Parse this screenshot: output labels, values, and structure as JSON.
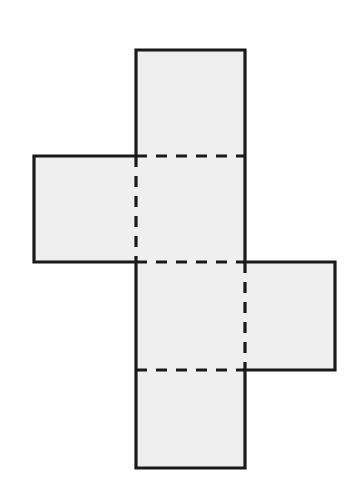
{
  "figure": {
    "type": "geometric-diagram",
    "canvas": {
      "width": 357,
      "height": 490
    },
    "colors": {
      "background": "#ffffff",
      "face_fill": "#efefef",
      "edge_stroke": "#1a1a1a",
      "fold_stroke": "#1a1a1a"
    },
    "stroke": {
      "outline_width": 3.2,
      "fold_width": 3.2,
      "fold_dash": "11 9"
    },
    "grid": {
      "columns_x": [
        34,
        136,
        245,
        335
      ],
      "rows_y": [
        50,
        156,
        262,
        370,
        468
      ]
    },
    "faces": [
      {
        "name": "top-face",
        "x": 136,
        "y": 50,
        "w": 109,
        "h": 106
      },
      {
        "name": "left-face",
        "x": 34,
        "y": 156,
        "w": 102,
        "h": 106
      },
      {
        "name": "front-upper-face",
        "x": 136,
        "y": 156,
        "w": 109,
        "h": 106
      },
      {
        "name": "front-lower-face",
        "x": 136,
        "y": 262,
        "w": 109,
        "h": 108
      },
      {
        "name": "right-face",
        "x": 245,
        "y": 262,
        "w": 90,
        "h": 108
      },
      {
        "name": "bottom-face",
        "x": 136,
        "y": 370,
        "w": 109,
        "h": 98
      }
    ],
    "outline_path": "M 136 50 L 245 50 L 245 262 L 335 262 L 335 370 L 245 370 L 245 468 L 136 468 L 136 262 L 34 262 L 34 156 L 136 156 Z",
    "solid_edges": [
      {
        "name": "top-face-top-edge",
        "x1": 136,
        "y1": 50,
        "x2": 245,
        "y2": 50
      },
      {
        "name": "top-face-left-edge",
        "x1": 136,
        "y1": 50,
        "x2": 136,
        "y2": 156
      },
      {
        "name": "top-face-right-edge",
        "x1": 245,
        "y1": 50,
        "x2": 245,
        "y2": 156
      },
      {
        "name": "left-face-top-edge",
        "x1": 34,
        "y1": 156,
        "x2": 136,
        "y2": 156
      },
      {
        "name": "left-face-left-edge",
        "x1": 34,
        "y1": 156,
        "x2": 34,
        "y2": 262
      },
      {
        "name": "left-face-bottom-edge",
        "x1": 34,
        "y1": 262,
        "x2": 136,
        "y2": 262
      },
      {
        "name": "center-right-edge",
        "x1": 245,
        "y1": 156,
        "x2": 245,
        "y2": 262
      },
      {
        "name": "right-face-top-edge",
        "x1": 245,
        "y1": 262,
        "x2": 335,
        "y2": 262
      },
      {
        "name": "right-face-right-edge",
        "x1": 335,
        "y1": 262,
        "x2": 335,
        "y2": 370
      },
      {
        "name": "right-face-bottom-edge",
        "x1": 245,
        "y1": 370,
        "x2": 335,
        "y2": 370
      },
      {
        "name": "center-left-edge-lower",
        "x1": 136,
        "y1": 262,
        "x2": 136,
        "y2": 468
      },
      {
        "name": "bottom-face-bottom-edge",
        "x1": 136,
        "y1": 468,
        "x2": 245,
        "y2": 468
      },
      {
        "name": "bottom-face-right-edge",
        "x1": 245,
        "y1": 370,
        "x2": 245,
        "y2": 468
      }
    ],
    "fold_edges": [
      {
        "name": "fold-top-to-front",
        "orientation": "horizontal",
        "x1": 136,
        "y1": 156,
        "x2": 245,
        "y2": 156
      },
      {
        "name": "fold-front-upper-to-lower",
        "orientation": "horizontal",
        "x1": 136,
        "y1": 262,
        "x2": 245,
        "y2": 262
      },
      {
        "name": "fold-front-to-bottom",
        "orientation": "horizontal",
        "x1": 136,
        "y1": 370,
        "x2": 245,
        "y2": 370
      },
      {
        "name": "fold-left-to-front",
        "orientation": "vertical",
        "x1": 136,
        "y1": 156,
        "x2": 136,
        "y2": 262
      },
      {
        "name": "fold-front-to-right",
        "orientation": "vertical",
        "x1": 245,
        "y1": 262,
        "x2": 245,
        "y2": 370
      }
    ]
  }
}
